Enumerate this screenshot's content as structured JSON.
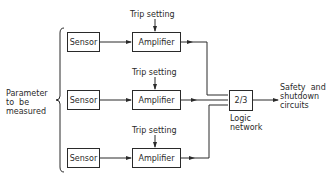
{
  "diagram": {
    "input_label": "Parameter\nto  be\nmeasured",
    "channels": [
      {
        "sensor": "Sensor",
        "amplifier": "Amplifier",
        "trip": "Trip setting"
      },
      {
        "sensor": "Sensor",
        "amplifier": "Amplifier",
        "trip": "Trip setting"
      },
      {
        "sensor": "Sensor",
        "amplifier": "Amplifier",
        "trip": "Trip setting"
      }
    ],
    "logic": {
      "label": "2/3",
      "caption": "Logic\nnetwork"
    },
    "output_label": "Safety  and\nshutdown\ncircuits"
  },
  "colors": {
    "line": "#2a2a2a",
    "background": "#ffffff"
  }
}
